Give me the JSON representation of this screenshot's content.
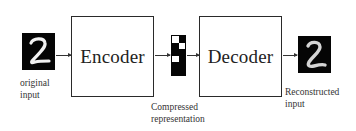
{
  "diagram": {
    "input": {
      "image": "handwritten-digit-2",
      "caption_line1": "original",
      "caption_line2": "input"
    },
    "encoder": {
      "label": "Encoder"
    },
    "code": {
      "caption_line1": "Compressed",
      "caption_line2": "representation",
      "pattern": [
        [
          1,
          0
        ],
        [
          0,
          1
        ],
        [
          0,
          0
        ],
        [
          1,
          0
        ],
        [
          0,
          0
        ],
        [
          0,
          0
        ]
      ]
    },
    "decoder": {
      "label": "Decoder"
    },
    "output": {
      "image": "handwritten-digit-2-reconstructed",
      "caption_line1": "Reconstructed",
      "caption_line2": "input"
    },
    "edges": [
      {
        "from": "input",
        "to": "encoder"
      },
      {
        "from": "encoder",
        "to": "code"
      },
      {
        "from": "code",
        "to": "decoder"
      },
      {
        "from": "decoder",
        "to": "output"
      }
    ],
    "colors": {
      "background": "#ffffff",
      "stroke": "#2a2a2a",
      "image_bg": "#050505",
      "digit": "#f2f2f2"
    }
  }
}
